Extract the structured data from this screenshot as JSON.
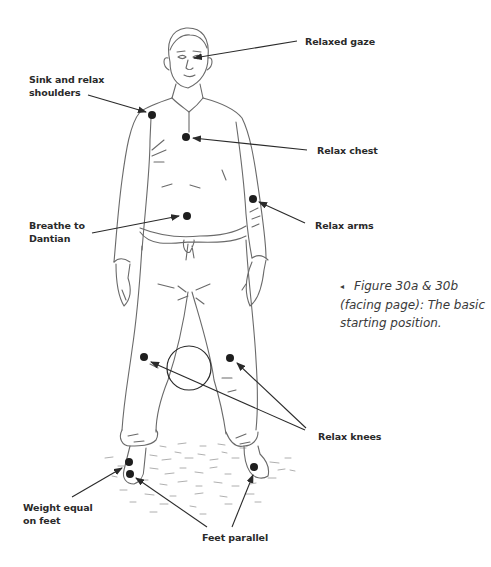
{
  "labels": {
    "relaxed_gaze": "Relaxed gaze",
    "shoulders_line1": "Sink and relax",
    "shoulders_line2": "shoulders",
    "relax_chest": "Relax chest",
    "relax_arms": "Relax arms",
    "dantian_line1": "Breathe to",
    "dantian_line2": "Dantian",
    "relax_knees": "Relax knees",
    "weight_line1": "Weight equal",
    "weight_line2": "on feet",
    "feet_parallel": "Feet parallel"
  },
  "caption": {
    "bullet": "◂",
    "line1": "Figure 30a & 30b",
    "line2": "(facing page): The basic",
    "line3": "starting position."
  },
  "colors": {
    "ink": "#2a2a2a",
    "sketch": "#6a6a6a",
    "background": "#ffffff"
  }
}
